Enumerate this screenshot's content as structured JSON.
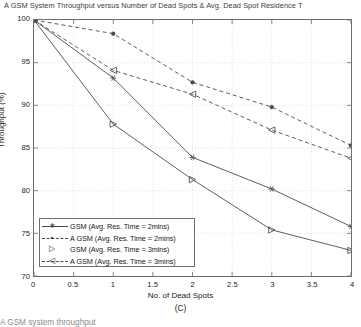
{
  "chart_data": {
    "type": "line",
    "title": "A  GSM System Throughput versus Number of Dead Spots & Avg. Dead Spot Residence T",
    "xlabel": "No. of Dead Spots",
    "ylabel": "Throughput (%)",
    "panel_label": "(C)",
    "caption_partial": "A GSM system throughput",
    "x": [
      0,
      1,
      2,
      3,
      4
    ],
    "xlim": [
      0,
      4
    ],
    "ylim": [
      70,
      100
    ],
    "xticks": [
      0,
      0.5,
      1,
      1.5,
      2,
      2.5,
      3,
      3.5,
      4
    ],
    "xticklabels": [
      "0",
      "0.5",
      "1",
      "1.5",
      "2",
      "2.5",
      "3",
      "3.5",
      "4"
    ],
    "yticks": [
      70,
      75,
      80,
      85,
      90,
      95,
      100
    ],
    "yticklabels": [
      "70",
      "75",
      "80",
      "85",
      "90",
      "95",
      "100"
    ],
    "grid": true,
    "legend_position": "lower left",
    "series": [
      {
        "name": "GSM (Avg. Res. Time = 2mins)",
        "marker": "asterisk",
        "linestyle": "solid",
        "color": "#4a4a4a",
        "values": [
          100,
          93.2,
          83.9,
          80.2,
          75.8
        ]
      },
      {
        "name": "A  GSM (Avg. Res. Time = 2mins)",
        "marker": "dot",
        "linestyle": "dashed",
        "color": "#4a4a4a",
        "values": [
          100,
          98.4,
          92.7,
          89.8,
          85.3
        ]
      },
      {
        "name": "GSM (Avg. Res. Time = 3mins)",
        "marker": "triangle-right",
        "linestyle": "solid",
        "color": "#4a4a4a",
        "values": [
          100,
          87.8,
          81.3,
          75.4,
          73.0
        ]
      },
      {
        "name": "A  GSM (Avg. Res. Time = 3mins)",
        "marker": "triangle-left",
        "linestyle": "dashed",
        "color": "#4a4a4a",
        "values": [
          100,
          94.1,
          91.3,
          87.1,
          83.8
        ]
      }
    ]
  },
  "legend": {
    "items": [
      {
        "label": "GSM (Avg. Res. Time = 2mins)",
        "glyph": "∗",
        "style": "solid"
      },
      {
        "label": "A  GSM (Avg. Res. Time = 2mins)",
        "glyph": "•",
        "style": "dashed"
      },
      {
        "label": "GSM (Avg. Res. Time = 3mins)",
        "glyph": "▷",
        "style": "none"
      },
      {
        "label": "A  GSM (Avg. Res. Time = 3mins)",
        "glyph": "◁",
        "style": "dashed"
      }
    ]
  }
}
